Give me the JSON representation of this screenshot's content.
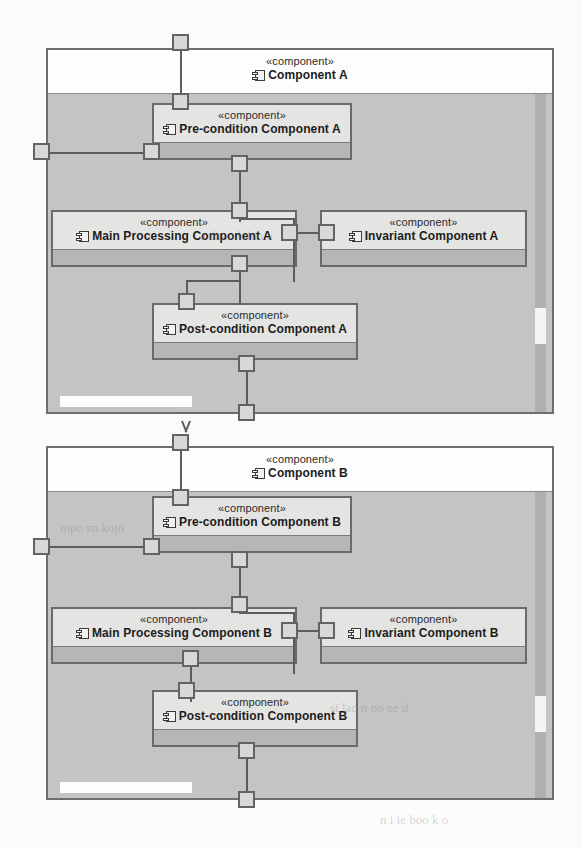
{
  "diagram": {
    "title_stereotype": "«component»",
    "icon_name": "component-icon",
    "outer_components": [
      {
        "id": "component-a",
        "stereotype": "«component»",
        "name": "Component A",
        "inner_components": [
          {
            "id": "pre-condition-a",
            "stereotype": "«component»",
            "name": "Pre-condition Component A"
          },
          {
            "id": "main-processing-a",
            "stereotype": "«component»",
            "name": "Main Processing Component A"
          },
          {
            "id": "invariant-a",
            "stereotype": "«component»",
            "name": "Invariant Component A"
          },
          {
            "id": "post-condition-a",
            "stereotype": "«component»",
            "name": "Post-condition Component A"
          }
        ]
      },
      {
        "id": "component-b",
        "stereotype": "«component»",
        "name": "Component B",
        "inner_components": [
          {
            "id": "pre-condition-b",
            "stereotype": "«component»",
            "name": "Pre-condition Component B"
          },
          {
            "id": "main-processing-b",
            "stereotype": "«component»",
            "name": "Main Processing Component B"
          },
          {
            "id": "invariant-b",
            "stereotype": "«component»",
            "name": "Invariant Component B"
          },
          {
            "id": "post-condition-b",
            "stereotype": "«component»",
            "name": "Post-condition Component B"
          }
        ]
      }
    ],
    "colors": {
      "frame_border": "#6e6e6e",
      "outer_body": "#c4c4c4",
      "outer_header": "#fdfdfd",
      "inner_border": "#6a6a6a",
      "inner_header": "#e4e4e2",
      "inner_body": "#b6b6b6",
      "port_fill": "#d8d8d6",
      "connector": "#5c5c5c",
      "page_background": "#fbfbfa"
    },
    "bleed_text": [
      "a daun lebih a",
      "mpo sn kojn",
      "si lad n no ee d",
      "n i ie boo k o"
    ]
  }
}
